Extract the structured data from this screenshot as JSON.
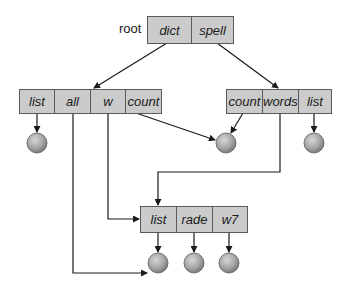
{
  "diagram": {
    "root": {
      "label": "root",
      "cells": [
        "dict",
        "spell"
      ]
    },
    "dict_node": {
      "cells": [
        "list",
        "all",
        "w",
        "count"
      ]
    },
    "spell_node": {
      "cells": [
        "count",
        "words",
        "list"
      ]
    },
    "list_node": {
      "cells": [
        "list",
        "rade",
        "w7"
      ]
    },
    "files": {
      "count": 6,
      "fill_color": "#a8a8a8"
    },
    "colors": {
      "box_fill": "#cbcbcb",
      "line": "#1a1a1a"
    }
  }
}
